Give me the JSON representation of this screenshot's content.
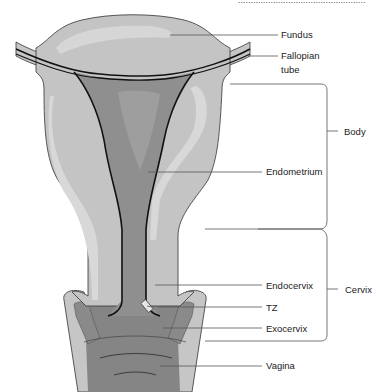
{
  "figure": {
    "type": "anatomical-diagram",
    "top_cutoff_text": "...................................................",
    "colors": {
      "outer_tissue": "#c4c4c4",
      "outer_highlight": "#dadada",
      "endometrium": "#8e8e8e",
      "vagina": "#7e7e7e",
      "outline": "#111111",
      "leader_line": "#555555"
    }
  },
  "labels": {
    "fundus": "Fundus",
    "fallopian_line1": "Fallopian",
    "fallopian_line2": "tube",
    "endometrium": "Endometrium",
    "endocervix": "Endocervix",
    "tz": "TZ",
    "exocervix": "Exocervix",
    "vagina": "Vagina"
  },
  "brackets": {
    "body": "Body",
    "cervix": "Cervix"
  }
}
